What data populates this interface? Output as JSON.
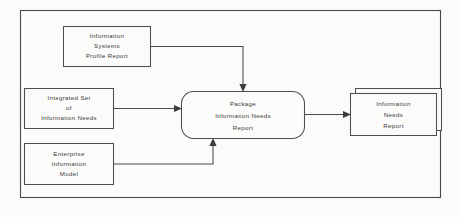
{
  "diagram": {
    "type": "data-flow-diagram",
    "frame": {
      "name": "diagram-frame"
    },
    "colors": {
      "background": "#fbfbfa",
      "line": "#4a4a4a",
      "text": "#3a3a3a",
      "arrow": "#3d3d3d"
    },
    "nodes": [
      {
        "id": "information-systems-profile-report",
        "shape": "rectangle",
        "role": "input-data-store",
        "lines": [
          "Information",
          "Systems",
          "Profile  Report"
        ]
      },
      {
        "id": "integrated-set-of-information-needs",
        "shape": "rectangle",
        "role": "input-data-store",
        "lines": [
          "Integrated  Set",
          "of",
          "Information  Needs"
        ]
      },
      {
        "id": "enterprise-information-model",
        "shape": "rectangle",
        "role": "input-data-store",
        "lines": [
          "Enterprise",
          "Information",
          "Model"
        ]
      },
      {
        "id": "package-information-needs-report",
        "shape": "rounded-rectangle",
        "role": "process",
        "lines": [
          "Package",
          "Information  Needs",
          "Report"
        ]
      },
      {
        "id": "information-needs-report",
        "shape": "stacked-rectangle",
        "role": "output-document",
        "lines": [
          "Information",
          "Needs",
          "Report"
        ]
      }
    ],
    "flows": [
      {
        "id": "profile-report-to-process",
        "from": "information-systems-profile-report",
        "to": "package-information-needs-report",
        "routing": "right-then-down"
      },
      {
        "id": "needs-set-to-process",
        "from": "integrated-set-of-information-needs",
        "to": "package-information-needs-report",
        "routing": "straight-right"
      },
      {
        "id": "enterprise-model-to-process",
        "from": "enterprise-information-model",
        "to": "package-information-needs-report",
        "routing": "right-then-up"
      },
      {
        "id": "process-to-report",
        "from": "package-information-needs-report",
        "to": "information-needs-report",
        "routing": "straight-right"
      }
    ]
  }
}
